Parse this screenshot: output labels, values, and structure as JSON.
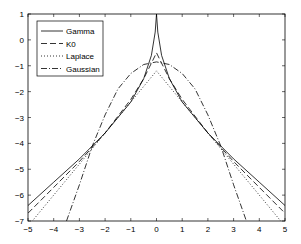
{
  "chart_data": {
    "type": "line",
    "title": "",
    "xlabel": "",
    "ylabel": "",
    "xlim": [
      -5,
      5
    ],
    "ylim": [
      -7,
      1
    ],
    "xticks": [
      "-5",
      "-4",
      "-3",
      "-2",
      "-1",
      "0",
      "1",
      "2",
      "3",
      "4",
      "5"
    ],
    "yticks": [
      "1",
      "0",
      "-1",
      "-2",
      "-3",
      "-4",
      "-5",
      "-6",
      "-7"
    ],
    "grid": false,
    "legend_position": "upper-left",
    "series": [
      {
        "name": "Gamma",
        "style": "solid",
        "x": [
          -5,
          -4,
          -3,
          -2,
          -1,
          -0.5,
          -0.2,
          -0.05,
          0,
          0.05,
          0.2,
          0.5,
          1,
          2,
          3,
          4,
          5
        ],
        "y": [
          -6.4,
          -5.5,
          -4.6,
          -3.6,
          -2.4,
          -1.5,
          -0.6,
          0.3,
          1,
          0.3,
          -0.6,
          -1.5,
          -2.4,
          -3.6,
          -4.6,
          -5.5,
          -6.4
        ]
      },
      {
        "name": "K0",
        "style": "dashed",
        "x": [
          -5,
          -4,
          -3,
          -2,
          -1,
          -0.5,
          -0.2,
          0,
          0.2,
          0.5,
          1,
          2,
          3,
          4,
          5
        ],
        "y": [
          -6.7,
          -5.7,
          -4.7,
          -3.6,
          -2.3,
          -1.5,
          -0.9,
          -0.5,
          -0.9,
          -1.5,
          -2.3,
          -3.6,
          -4.7,
          -5.7,
          -6.7
        ]
      },
      {
        "name": "Laplace",
        "style": "dotted",
        "x": [
          -5,
          -4,
          -3,
          -2,
          -1,
          0,
          1,
          2,
          3,
          4,
          5
        ],
        "y": [
          -7.2,
          -6.0,
          -4.8,
          -3.6,
          -2.4,
          -1.2,
          -2.4,
          -3.6,
          -4.8,
          -6.0,
          -7.2
        ]
      },
      {
        "name": "Gaussian",
        "style": "dashdot",
        "x": [
          -3.5,
          -3,
          -2.5,
          -2,
          -1.5,
          -1,
          -0.5,
          0,
          0.5,
          1,
          1.5,
          2,
          2.5,
          3,
          3.5
        ],
        "y": [
          -7,
          -5.6,
          -4.1,
          -2.9,
          -1.9,
          -1.3,
          -0.95,
          -0.85,
          -0.95,
          -1.3,
          -1.9,
          -2.9,
          -4.1,
          -5.6,
          -7
        ]
      }
    ]
  }
}
